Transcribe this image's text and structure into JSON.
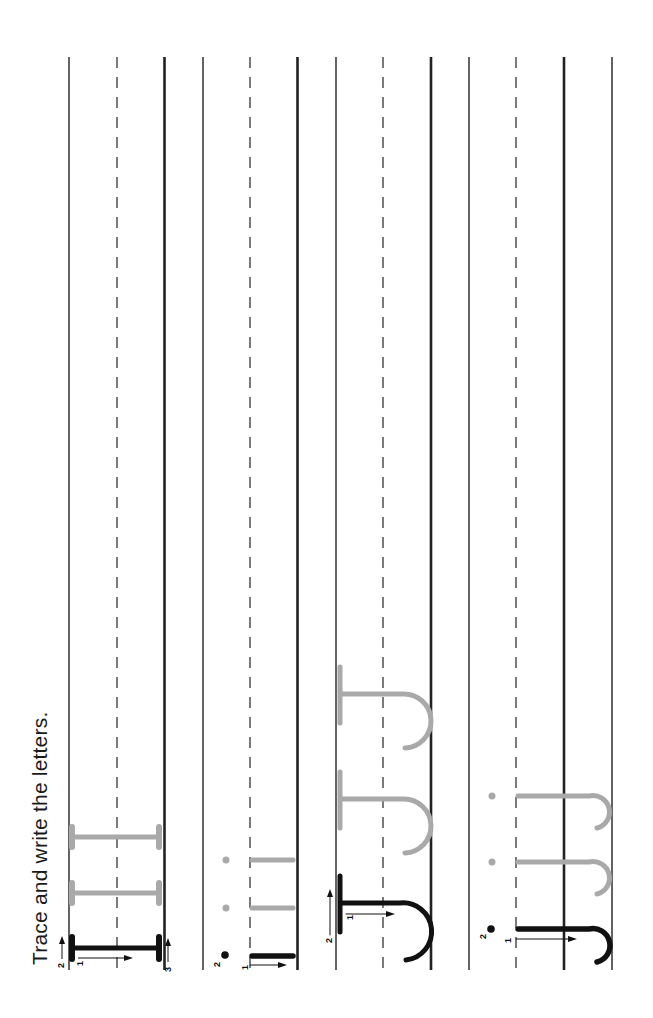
{
  "instruction": "Trace and write the letters.",
  "colors": {
    "ink": "#111111",
    "trace_gray": "#a9a9a9",
    "line": "#222222"
  },
  "rows": [
    {
      "letter": "I",
      "case": "uppercase",
      "model_strokes": [
        "1",
        "2",
        "3"
      ],
      "trace_copies": 2
    },
    {
      "letter": "i",
      "case": "lowercase",
      "model_strokes": [
        "1",
        "2"
      ],
      "trace_copies": 2
    },
    {
      "letter": "J",
      "case": "uppercase",
      "model_strokes": [
        "1",
        "2"
      ],
      "trace_copies": 2
    },
    {
      "letter": "j",
      "case": "lowercase",
      "model_strokes": [
        "1",
        "2"
      ],
      "trace_copies": 2
    }
  ],
  "stroke_labels": {
    "row1": {
      "a": "1",
      "b": "2",
      "c": "3"
    },
    "row2": {
      "a": "1",
      "b": "2"
    },
    "row3": {
      "a": "1",
      "b": "2"
    },
    "row4": {
      "a": "1",
      "b": "2"
    }
  }
}
